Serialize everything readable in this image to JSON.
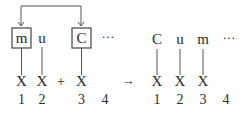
{
  "left": {
    "top_tokens": [
      {
        "label": "m",
        "boxed": true
      },
      {
        "label": "u",
        "boxed": false
      },
      {
        "label": "C",
        "boxed": true
      },
      {
        "label": "···",
        "boxed": false
      }
    ],
    "bottom_tokens": [
      "X",
      "X",
      "X"
    ],
    "plus": "+",
    "indices": [
      "1",
      "2",
      "3",
      "4"
    ]
  },
  "arrow": "→",
  "right": {
    "top_tokens": [
      "C",
      "u",
      "m",
      "···"
    ],
    "bottom_tokens": [
      "X",
      "X",
      "X"
    ],
    "indices": [
      "1",
      "2",
      "3",
      "4"
    ]
  }
}
